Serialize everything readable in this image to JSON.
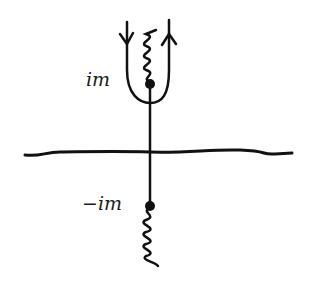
{
  "diagram": {
    "labels": {
      "upper_point": "im",
      "lower_point": "−im"
    },
    "elements": {
      "real_axis": "horizontal line",
      "imaginary_axis": "vertical line",
      "upper_branch_point": "filled dot at im",
      "lower_branch_point": "filled dot at -im",
      "upper_branch_cut": "wavy line from im upward",
      "lower_branch_cut": "wavy line from -im downward",
      "contour": "U-shaped contour wrapping upper branch cut, left side downward arrow, right side upward arrow"
    },
    "colors": {
      "ink": "#111111",
      "background": "#ffffff"
    }
  }
}
